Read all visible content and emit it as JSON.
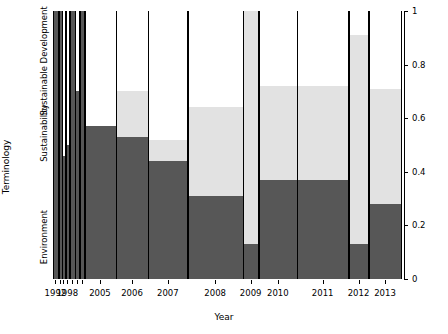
{
  "chart_data": {
    "type": "bar",
    "subtype": "spineplot",
    "title": "",
    "xlabel": "Year",
    "ylabel": "Terminology",
    "ylim": [
      0,
      1
    ],
    "xtick_labels": [
      "1992",
      "1998",
      "2005",
      "2006",
      "2007",
      "2008",
      "2009",
      "2010",
      "2011",
      "2012",
      "2013"
    ],
    "ytick_labels": [
      "0",
      "0.2",
      "0.4",
      "0.6",
      "0.8",
      "1"
    ],
    "ytick_values": [
      0,
      0.2,
      0.4,
      0.6,
      0.8,
      1
    ],
    "grid": false,
    "legend": "none",
    "category_labels": [
      "Environment",
      "Sustainability",
      "Sustainable Development"
    ],
    "categories": [
      "Environment",
      "Sustainability",
      "Sustainable Development"
    ],
    "colors": {
      "Environment": "#575757",
      "Sustainability": "#e2e2e2",
      "Sustainable Development": "#ffffff",
      "axis": "#000000",
      "background": "#ffffff"
    },
    "note": "Bar widths are proportional to the number of documents per year; bar heights are proportions summing to 1.",
    "bars": [
      {
        "year": "1992",
        "x_left": 0.0,
        "x_right": 0.014,
        "Environment": 1.0,
        "Sustainability": 0.0,
        "Sustainable Development": 0.0
      },
      {
        "year": "1993",
        "x_left": 0.016,
        "x_right": 0.025,
        "Environment": 1.0,
        "Sustainability": 0.0,
        "Sustainable Development": 0.0
      },
      {
        "year": "1996",
        "x_left": 0.027,
        "x_right": 0.034,
        "Environment": 0.46,
        "Sustainability": 0.0,
        "Sustainable Development": 0.54
      },
      {
        "year": "1998",
        "x_left": 0.036,
        "x_right": 0.046,
        "Environment": 0.5,
        "Sustainability": 0.0,
        "Sustainable Development": 0.5
      },
      {
        "year": "2000",
        "x_left": 0.048,
        "x_right": 0.062,
        "Environment": 1.0,
        "Sustainability": 0.0,
        "Sustainable Development": 0.0
      },
      {
        "year": "2002",
        "x_left": 0.064,
        "x_right": 0.075,
        "Environment": 0.7,
        "Sustainability": 0.0,
        "Sustainable Development": 0.3
      },
      {
        "year": "2004",
        "x_left": 0.077,
        "x_right": 0.089,
        "Environment": 1.0,
        "Sustainability": 0.0,
        "Sustainable Development": 0.0
      },
      {
        "year": "2005",
        "x_left": 0.091,
        "x_right": 0.18,
        "Environment": 0.57,
        "Sustainability": 0.0,
        "Sustainable Development": 0.43
      },
      {
        "year": "2006",
        "x_left": 0.182,
        "x_right": 0.272,
        "Environment": 0.53,
        "Sustainability": 0.17,
        "Sustainable Development": 0.3
      },
      {
        "year": "2007",
        "x_left": 0.274,
        "x_right": 0.386,
        "Environment": 0.44,
        "Sustainability": 0.08,
        "Sustainable Development": 0.48
      },
      {
        "year": "2008",
        "x_left": 0.388,
        "x_right": 0.545,
        "Environment": 0.31,
        "Sustainability": 0.33,
        "Sustainable Development": 0.36
      },
      {
        "year": "2009",
        "x_left": 0.547,
        "x_right": 0.59,
        "Environment": 0.13,
        "Sustainability": 0.87,
        "Sustainable Development": 0.0
      },
      {
        "year": "2010",
        "x_left": 0.592,
        "x_right": 0.7,
        "Environment": 0.37,
        "Sustainability": 0.35,
        "Sustainable Development": 0.28
      },
      {
        "year": "2011",
        "x_left": 0.702,
        "x_right": 0.848,
        "Environment": 0.37,
        "Sustainability": 0.35,
        "Sustainable Development": 0.28
      },
      {
        "year": "2012",
        "x_left": 0.85,
        "x_right": 0.906,
        "Environment": 0.13,
        "Sustainability": 0.78,
        "Sustainable Development": 0.09
      },
      {
        "year": "2013",
        "x_left": 0.908,
        "x_right": 1.0,
        "Environment": 0.28,
        "Sustainability": 0.43,
        "Sustainable Development": 0.29
      }
    ],
    "xticks": [
      {
        "label": "1992",
        "pos": 0.007
      },
      {
        "label": "1998",
        "pos": 0.041
      },
      {
        "label": "2005",
        "pos": 0.135
      },
      {
        "label": "2006",
        "pos": 0.227
      },
      {
        "label": "2007",
        "pos": 0.33
      },
      {
        "label": "2008",
        "pos": 0.466
      },
      {
        "label": "2009",
        "pos": 0.568
      },
      {
        "label": "2010",
        "pos": 0.646
      },
      {
        "label": "2011",
        "pos": 0.775
      },
      {
        "label": "2012",
        "pos": 0.878
      },
      {
        "label": "2013",
        "pos": 0.954
      }
    ],
    "minor_xticks": [
      0.021,
      0.03,
      0.055,
      0.07,
      0.083
    ],
    "category_label_positions": [
      0.155,
      0.545,
      0.815
    ]
  }
}
